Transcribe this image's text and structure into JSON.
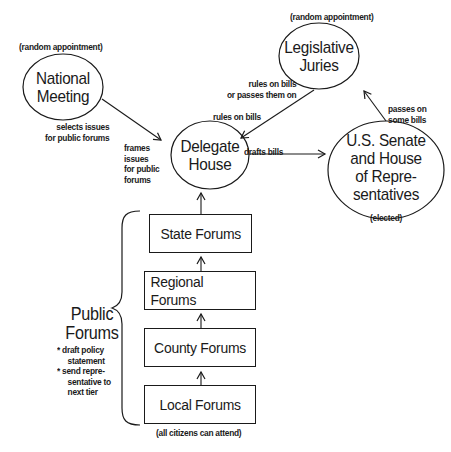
{
  "nodes": {
    "national_meeting": {
      "line1": "National",
      "line2": "Meeting",
      "note": "(random appointment)"
    },
    "legislative_juries": {
      "line1": "Legislative",
      "line2": "Juries",
      "note": "(random appointment)"
    },
    "delegate_house": {
      "line1": "Delegate",
      "line2": "House"
    },
    "congress": {
      "line1": "U.S. Senate",
      "line2": "and House",
      "line3": "of Repre-",
      "line4": "sentatives",
      "note": "(elected)"
    }
  },
  "forums": [
    {
      "label": "State Forums"
    },
    {
      "label": "Regional Forums"
    },
    {
      "label": "County Forums"
    },
    {
      "label": "Local Forums",
      "note": "(all citizens can attend)"
    }
  ],
  "public_forums": {
    "title_line1": "Public",
    "title_line2": "Forums",
    "bullets": [
      "* draft policy",
      "statement",
      "* send repre-",
      "sentative to",
      "next tier"
    ]
  },
  "edge_labels": {
    "selects_1": "selects issues",
    "selects_2": "for public forums",
    "frames_1": "frames",
    "frames_2": "issues",
    "frames_3": "for public",
    "frames_4": "forums",
    "juries_rule_1": "rules on bills",
    "juries_rule_2": "or passes them on",
    "rules_on_bills": "rules on bills",
    "drafts_bills": "drafts bills",
    "passes_1": "passes on",
    "passes_2": "some bills"
  }
}
